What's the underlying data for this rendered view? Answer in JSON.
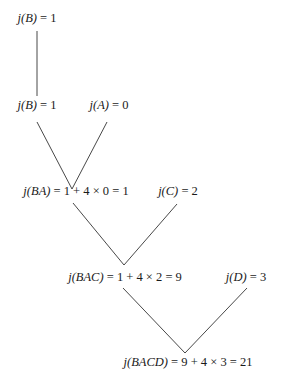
{
  "title": "",
  "nodes": [
    {
      "id": "n1",
      "label": "j(B) = 1"
    },
    {
      "id": "n2",
      "label": "j(B) = 1"
    },
    {
      "id": "n3",
      "label": "j(A) = 0"
    },
    {
      "id": "n4",
      "label": "j(BA) = 1 + 4 × 0 = 1"
    },
    {
      "id": "n5",
      "label": "j(C) = 2"
    },
    {
      "id": "n6",
      "label": "j(BAC) = 1 + 4 × 2 = 9"
    },
    {
      "id": "n7",
      "label": "j(D) = 3"
    },
    {
      "id": "n8",
      "label": "j(BACD) = 9 + 4 × 3 = 21"
    }
  ],
  "edges": [
    {
      "from": "n1",
      "to": "n2"
    },
    {
      "from": "n2",
      "to": "n4"
    },
    {
      "from": "n3",
      "to": "n4"
    },
    {
      "from": "n4",
      "to": "n6"
    },
    {
      "from": "n5",
      "to": "n6"
    },
    {
      "from": "n6",
      "to": "n8"
    },
    {
      "from": "n7",
      "to": "n8"
    }
  ]
}
